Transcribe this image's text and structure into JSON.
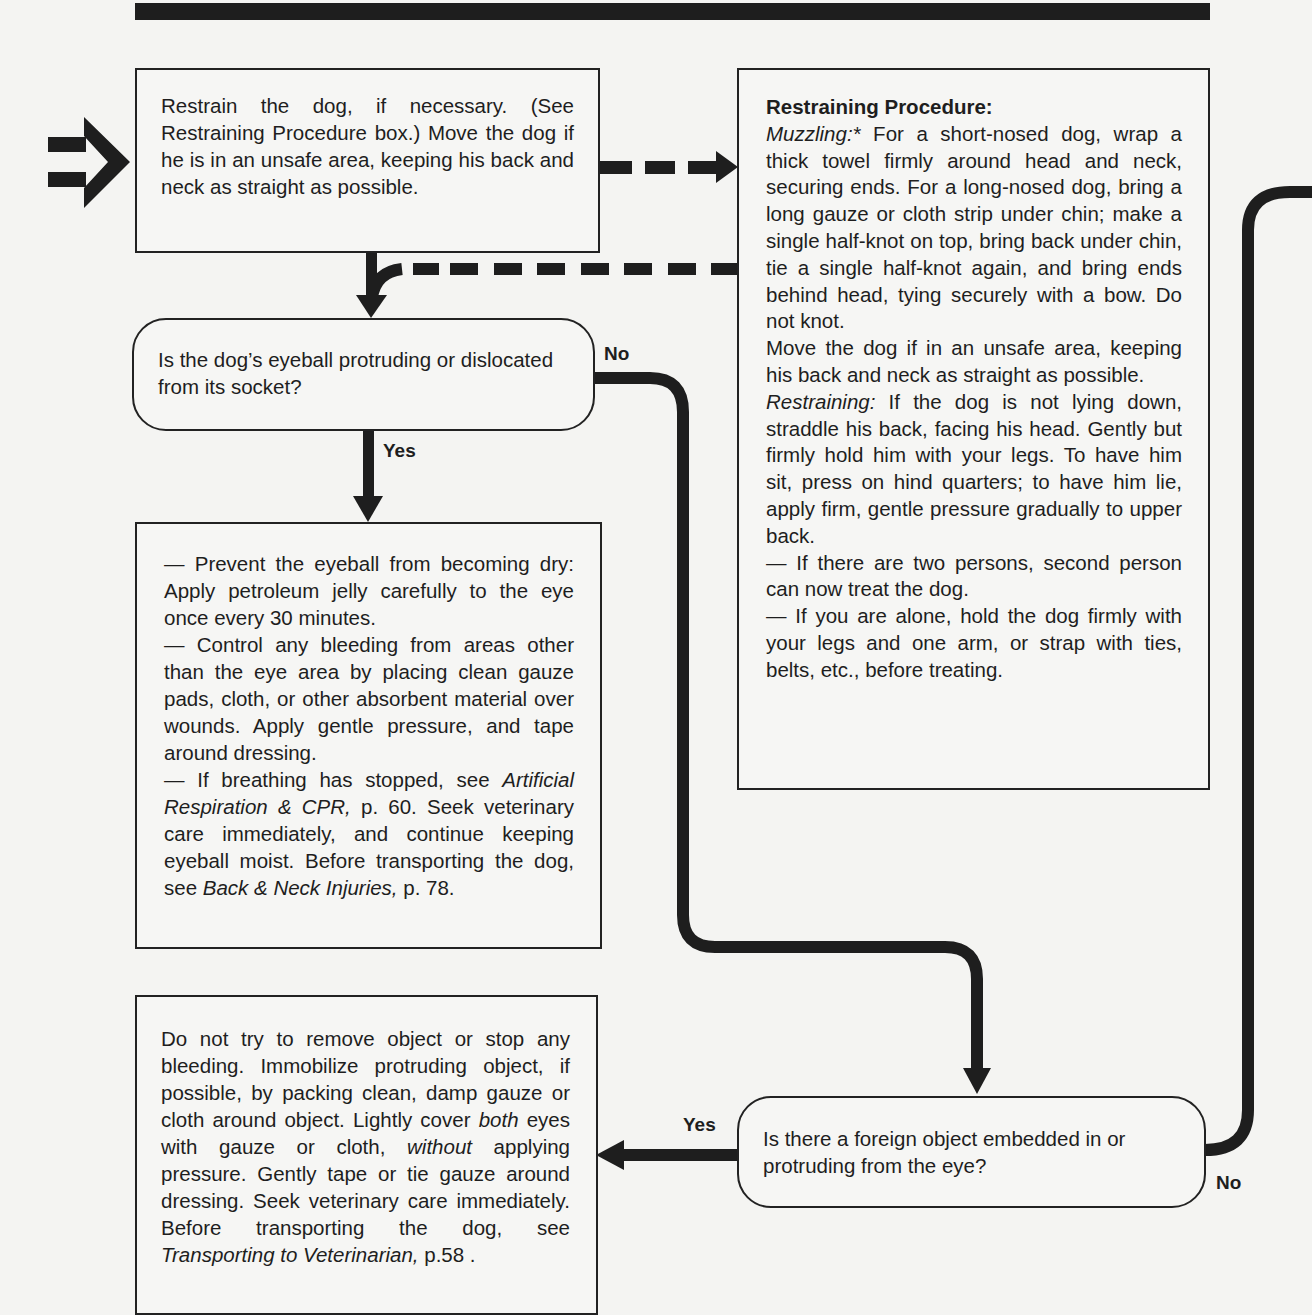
{
  "page": {
    "background": "#f4f4f2",
    "ink": "#1e1e1e"
  },
  "boxes": {
    "restrain": {
      "text": "Restrain the dog, if necessary. (See Restraining Procedure box.) Move the dog if he is in an unsafe area, keeping his back and neck as straight as possible."
    },
    "procedure": {
      "title": "Restraining Procedure:",
      "muzzling_label": "Muzzling:*",
      "muzzling_text": " For a short-nosed dog, wrap a thick towel firmly around head and neck, securing ends. For a long-nosed dog, bring a long gauze or cloth strip under chin; make a single half-knot on top, bring back under chin, tie a single half-knot again, and bring ends behind head, tying securely with a bow. Do not knot.",
      "move_text": "Move the dog if in an unsafe area, keeping his back and neck as straight as possible.",
      "restraining_label": "Restraining:",
      "restraining_text": " If the dog is not lying down, straddle his back, facing his head. Gently but firmly hold him with your legs. To have him sit, press on hind quarters; to have him lie, apply firm, gentle pressure gradually to upper back.",
      "two_persons": "— If there are two persons, second person can now treat the dog.",
      "alone": "— If you are alone, hold the dog firmly with your legs and one arm, or strap with ties, belts, etc., before treating."
    },
    "eyeball_question": {
      "text": "Is the dog’s eyeball protruding or dislocated from its socket?"
    },
    "eyeball_treatment": {
      "item1": "— Prevent the eyeball from becoming dry: Apply petroleum jelly carefully to the eye once every 30 minutes.",
      "item2": "— Control any bleeding from areas other than the eye area by placing clean gauze pads, cloth, or other absorbent material over wounds. Apply gentle pressure, and tape around dressing.",
      "item3_pre": "— If breathing has stopped, see ",
      "item3_ref1": "Artificial Respiration & CPR,",
      "item3_mid": " p. 60. Seek veterinary care immediately, and continue keeping eyeball moist. Before transporting the dog, see ",
      "item3_ref2": "Back & Neck Injuries,",
      "item3_post": " p. 78."
    },
    "object_treatment": {
      "part1": "Do not try to remove object or stop any bleeding. Immobilize protruding object, if possible, by packing clean, damp gauze or cloth around object. Lightly cover ",
      "em1": "both",
      "part2": " eyes with gauze or cloth, ",
      "em2": "without",
      "part3": " applying pressure. Gently tape or tie gauze around dressing. Seek veterinary care immediately. Before transporting the dog, see ",
      "em3": "Transporting to Veterinarian,",
      "part4": " p.58 ."
    },
    "object_question": {
      "text": "Is there a foreign object embedded in or protruding from the eye?"
    }
  },
  "labels": {
    "eyeball_no": "No",
    "eyeball_yes": "Yes",
    "object_yes": "Yes",
    "object_no": "No"
  }
}
